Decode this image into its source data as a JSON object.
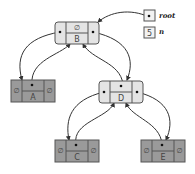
{
  "diagram": {
    "type": "binary-search-tree",
    "null_symbol": "∅",
    "variables": {
      "root": {
        "label": "root",
        "value": ""
      },
      "n": {
        "label": "n",
        "value": "5"
      }
    },
    "nodes": {
      "B": {
        "key": "B",
        "parent": "∅",
        "left": "A",
        "right": "D"
      },
      "A": {
        "key": "A",
        "parent": "B",
        "left": "∅",
        "right": "∅"
      },
      "D": {
        "key": "D",
        "parent": "B",
        "left": "C",
        "right": "E"
      },
      "C": {
        "key": "C",
        "parent": "D",
        "left": "∅",
        "right": "∅"
      },
      "E": {
        "key": "E",
        "parent": "D",
        "left": "∅",
        "right": "∅"
      }
    },
    "colors": {
      "internal_node": "#e4e4e4",
      "leaf_node": "#9a9a9a",
      "stroke": "#555555"
    }
  }
}
